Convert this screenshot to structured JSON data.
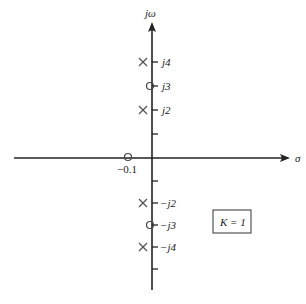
{
  "diagram": {
    "type": "pole-zero plot (s-plane)",
    "axes": {
      "x_label": "σ",
      "y_label": "jω"
    },
    "y_ticks": [
      "j4",
      "j3",
      "j2",
      "−j2",
      "−j3",
      "−j4"
    ],
    "poles": [
      {
        "re": 0,
        "im": 4,
        "symbol": "×"
      },
      {
        "re": 0,
        "im": 2,
        "symbol": "×"
      },
      {
        "re": 0,
        "im": -2,
        "symbol": "×"
      },
      {
        "re": 0,
        "im": -4,
        "symbol": "×"
      }
    ],
    "zeros": [
      {
        "re": 0,
        "im": 3,
        "symbol": "○"
      },
      {
        "re": 0,
        "im": -3,
        "symbol": "○"
      },
      {
        "re": -0.1,
        "im": 0,
        "symbol": "○"
      }
    ],
    "zero_label": "−0.1",
    "gain_box": "K = 1",
    "colors": {
      "axis": "#222222",
      "marker": "#555555"
    }
  }
}
